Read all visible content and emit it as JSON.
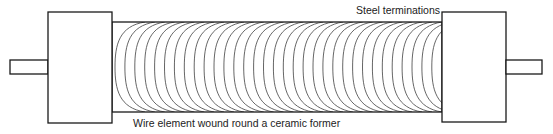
{
  "diagram": {
    "labels": {
      "terminations": "Steel terminations",
      "element": "Wire element wound round a ceramic former"
    },
    "colors": {
      "outline": "#1a1a1a",
      "wire": "#555555",
      "background": "#ffffff",
      "text": "#222222"
    },
    "geometry": {
      "left_shaft": {
        "x": 10,
        "y": 60,
        "w": 38,
        "h": 14
      },
      "left_cap": {
        "x": 48,
        "y": 12,
        "w": 64,
        "h": 111
      },
      "body": {
        "x": 112,
        "y": 22,
        "w": 330,
        "h": 90
      },
      "right_cap": {
        "x": 442,
        "y": 12,
        "w": 64,
        "h": 110
      },
      "right_shaft": {
        "x": 506,
        "y": 60,
        "w": 36,
        "h": 14
      }
    },
    "winding": {
      "turns": 33,
      "start_x": 115,
      "spacing": 9.9,
      "bulge": 30
    }
  }
}
